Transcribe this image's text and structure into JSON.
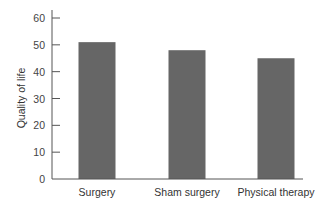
{
  "chart_data": {
    "type": "bar",
    "title": "",
    "xlabel": "",
    "ylabel": "Quality of life",
    "categories": [
      "Surgery",
      "Sham surgery",
      "Physical therapy"
    ],
    "values": [
      51,
      48,
      45
    ],
    "ylim": [
      0,
      60
    ],
    "yticks": [
      0,
      10,
      20,
      30,
      40,
      50,
      60
    ],
    "grid": false,
    "legend": null,
    "bar_color": "#666666",
    "axis_color": "#555555"
  }
}
